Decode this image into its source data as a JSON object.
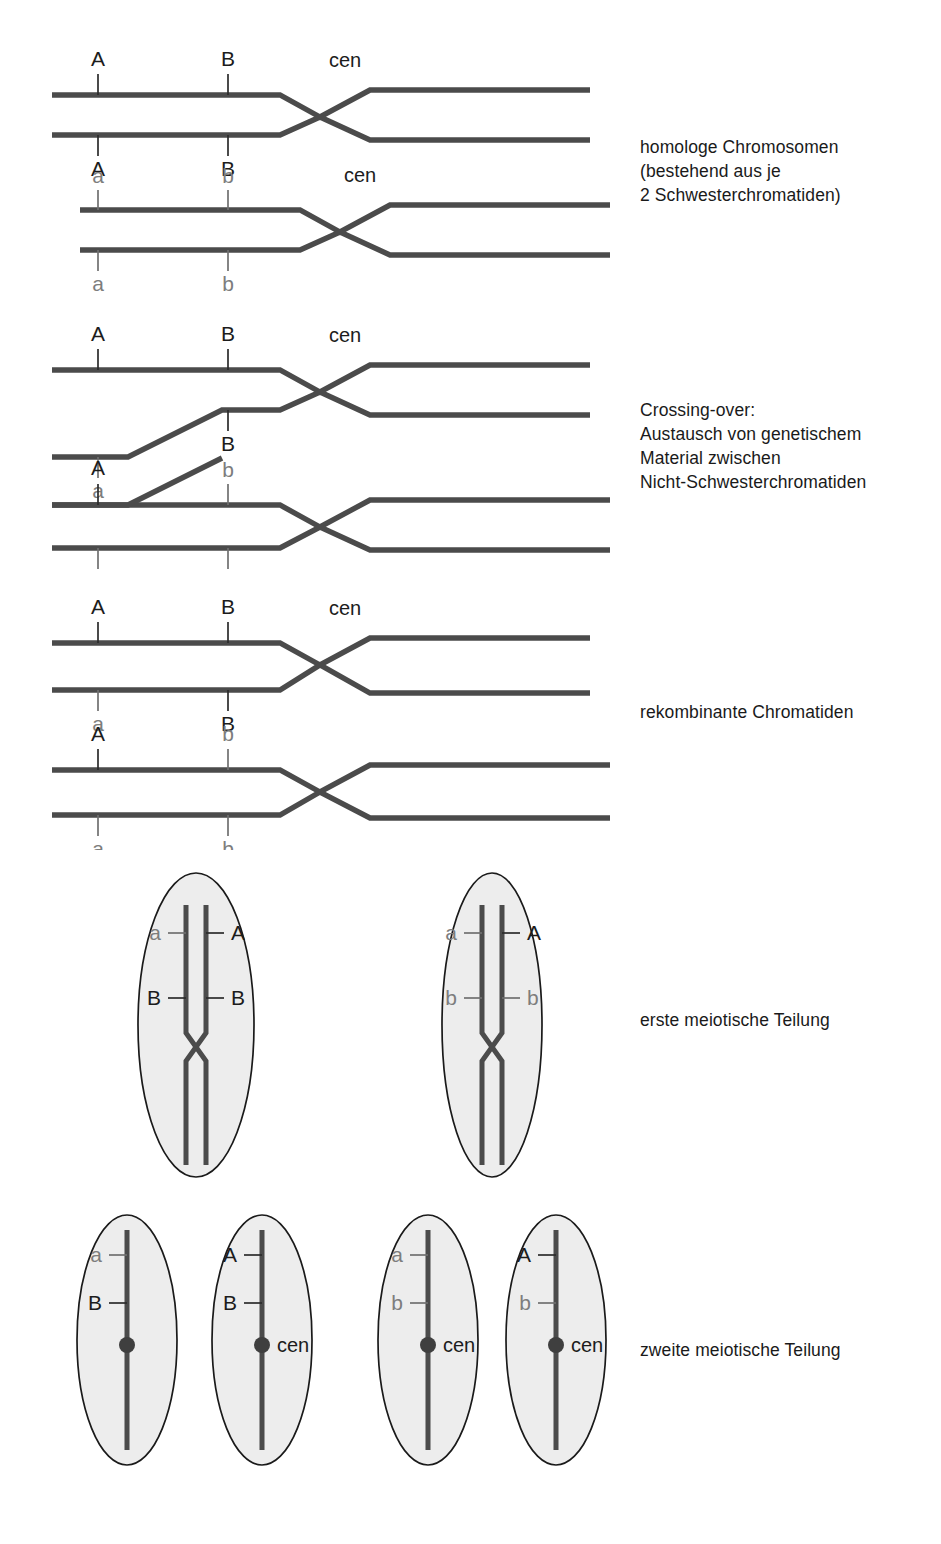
{
  "figure": {
    "background_color": "#ffffff",
    "line_color": "#4b4b4b",
    "dominant_label_color": "#1c1c1c",
    "recessive_label_color": "#7d7d7d",
    "cell_fill_color": "#ededed",
    "cell_outline_color": "#1a1a1a"
  },
  "labels": {
    "A": "A",
    "a": "a",
    "B": "B",
    "b": "b",
    "cen": "cen"
  },
  "stages": [
    {
      "id": "homologous-chromosomes",
      "caption": "homologe Chromosomen\n(bestehend aus je\n2 Schwesterchromatiden)",
      "chromosomes": [
        {
          "id": "chromosome-1",
          "chromatids": [
            {
              "id": "chromatid-1",
              "locus_A": "A",
              "locus_B": "B"
            },
            {
              "id": "chromatid-2",
              "locus_A": "A",
              "locus_B": "B"
            }
          ],
          "centromere": "cen"
        },
        {
          "id": "chromosome-2",
          "chromatids": [
            {
              "id": "chromatid-3",
              "locus_A": "a",
              "locus_B": "b"
            },
            {
              "id": "chromatid-4",
              "locus_A": "a",
              "locus_B": "b"
            }
          ],
          "centromere": "cen"
        }
      ]
    },
    {
      "id": "crossing-over",
      "caption": "Crossing-over:\nAustausch von genetischem\nMaterial zwischen\nNicht-Schwesterchromatiden",
      "chromosomes": [
        {
          "id": "chromosome-1",
          "chromatids": [
            {
              "id": "chromatid-1",
              "locus_A": "A",
              "locus_B": "B"
            },
            {
              "id": "chromatid-2",
              "locus_A": "a",
              "locus_B": "B"
            }
          ],
          "centromere": "cen"
        },
        {
          "id": "chromosome-2",
          "chromatids": [
            {
              "id": "chromatid-3",
              "locus_A": "A",
              "locus_B": "b"
            },
            {
              "id": "chromatid-4",
              "locus_A": "a",
              "locus_B": "b"
            }
          ],
          "centromere": ""
        }
      ]
    },
    {
      "id": "recombinant-chromatids",
      "caption": "rekombinante Chromatiden",
      "chromosomes": [
        {
          "id": "chromosome-1",
          "chromatids": [
            {
              "id": "chromatid-1",
              "locus_A": "A",
              "locus_B": "B"
            },
            {
              "id": "chromatid-2",
              "locus_A": "a",
              "locus_B": "B"
            }
          ],
          "centromere": "cen"
        },
        {
          "id": "chromosome-2",
          "chromatids": [
            {
              "id": "chromatid-3",
              "locus_A": "A",
              "locus_B": "b"
            },
            {
              "id": "chromatid-4",
              "locus_A": "a",
              "locus_B": "b"
            }
          ],
          "centromere": ""
        }
      ]
    },
    {
      "id": "first-meiotic-division",
      "caption": "erste meiotische Teilung",
      "cells": [
        {
          "id": "cell-1",
          "left_chromatid": {
            "locus_A": "a",
            "locus_B": "B"
          },
          "right_chromatid": {
            "locus_A": "A",
            "locus_B": "B"
          }
        },
        {
          "id": "cell-2",
          "left_chromatid": {
            "locus_A": "a",
            "locus_B": "b"
          },
          "right_chromatid": {
            "locus_A": "A",
            "locus_B": "b"
          }
        }
      ]
    },
    {
      "id": "second-meiotic-division",
      "caption": "zweite meiotische Teilung",
      "cells": [
        {
          "id": "gamete-1",
          "locus_A": "a",
          "locus_B": "B",
          "centromere": ""
        },
        {
          "id": "gamete-2",
          "locus_A": "A",
          "locus_B": "B",
          "centromere": "cen"
        },
        {
          "id": "gamete-3",
          "locus_A": "a",
          "locus_B": "b",
          "centromere": "cen"
        },
        {
          "id": "gamete-4",
          "locus_A": "A",
          "locus_B": "b",
          "centromere": "cen"
        }
      ]
    }
  ]
}
